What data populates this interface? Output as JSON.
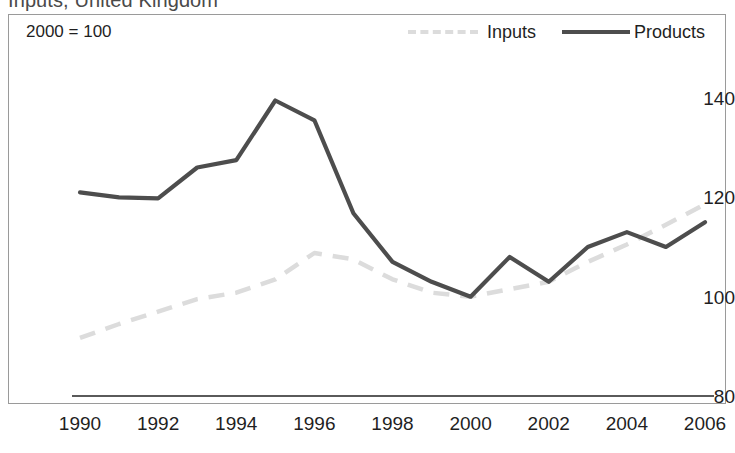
{
  "chart_title": "Inputs, United Kingdom",
  "index_note": "2000 = 100",
  "legend": {
    "items": [
      {
        "label": "Inputs",
        "style": "dashed",
        "color": "#dcdcdc"
      },
      {
        "label": "Products",
        "style": "solid",
        "color": "#4d4d4d"
      }
    ]
  },
  "colors": {
    "inputs_line": "#dcdcdc",
    "products_line": "#4d4d4d",
    "axis": "#5a5a5a",
    "frame": "#9a9a9a",
    "text": "#1f1f1f",
    "background": "#ffffff"
  },
  "axis": {
    "y_ticks": [
      "80",
      "100",
      "120",
      "140"
    ],
    "x_ticks": [
      "1990",
      "1992",
      "1994",
      "1996",
      "1998",
      "2000",
      "2002",
      "2004",
      "2006"
    ]
  },
  "chart_data": {
    "type": "line",
    "title": "Inputs, United Kingdom",
    "subtitle": "2000 = 100",
    "xlabel": "",
    "ylabel": "",
    "ylim": [
      80,
      145
    ],
    "xlim": [
      1990,
      2006
    ],
    "grid": false,
    "legend_position": "top-right",
    "x": [
      1990,
      1991,
      1992,
      1993,
      1994,
      1995,
      1996,
      1997,
      1998,
      1999,
      2000,
      2001,
      2002,
      2003,
      2004,
      2005,
      2006
    ],
    "series": [
      {
        "name": "Inputs",
        "style": "dashed",
        "color": "#dcdcdc",
        "values": [
          91.7,
          94.5,
          97.0,
          99.5,
          100.8,
          103.5,
          108.8,
          107.5,
          103.5,
          100.8,
          100.0,
          101.5,
          103.0,
          107.0,
          110.5,
          114.5,
          118.6
        ]
      },
      {
        "name": "Products",
        "style": "solid",
        "color": "#4d4d4d",
        "values": [
          121.0,
          120.0,
          119.8,
          126.0,
          127.5,
          139.5,
          135.5,
          116.8,
          107.0,
          103.0,
          100.0,
          108.0,
          103.0,
          110.0,
          113.0,
          110.0,
          115.0
        ]
      }
    ]
  }
}
